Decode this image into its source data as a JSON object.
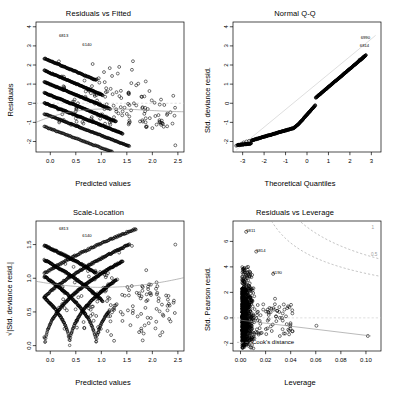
{
  "figure": {
    "layout": "2x2 grid of regression diagnostic plots",
    "width": 393,
    "height": 398,
    "background": "#ffffff",
    "point_color": "#000000",
    "smooth_color": "#8c8c8c",
    "reference_color": "#c8c8c8"
  },
  "chart_data": [
    {
      "type": "scatter",
      "title": "Residuals vs Fitted",
      "xlabel": "Predicted values",
      "ylabel": "Residuals",
      "xlim": [
        -0.28,
        2.62
      ],
      "ylim": [
        -2.55,
        4.25
      ],
      "xticks": [
        "0.0",
        "0.5",
        "1.0",
        "1.5",
        "2.0",
        "2.5"
      ],
      "xtickvals": [
        0.0,
        0.5,
        1.0,
        1.5,
        2.0,
        2.5
      ],
      "yticks": [
        "4",
        "3",
        "2",
        "1",
        "0",
        "-1",
        "-2"
      ],
      "ytickvals": [
        4,
        3,
        2,
        1,
        0,
        -1,
        -2
      ],
      "grid": false,
      "legend": "none",
      "annotations": [
        {
          "text": "6813",
          "x": 0.26,
          "y": 3.45
        },
        {
          "text": "6140",
          "x": 0.72,
          "y": 3.0
        }
      ],
      "zero_line": true,
      "smooth_curve": true,
      "description": "Dense parallel diagonal bands of residuals typical of a GLM with discrete outcome; band slope negative, plus scattered open circles at higher predicted values."
    },
    {
      "type": "scatter",
      "title": "Normal Q-Q",
      "xlabel": "Theoretical Quantiles",
      "ylabel": "Std. deviance resid.",
      "xlim": [
        -3.45,
        3.45
      ],
      "ylim": [
        -2.55,
        4.25
      ],
      "xticks": [
        "-3",
        "-2",
        "-1",
        "0",
        "1",
        "2",
        "3"
      ],
      "xtickvals": [
        -3,
        -2,
        -1,
        0,
        1,
        2,
        3
      ],
      "yticks": [
        "4",
        "3",
        "2",
        "1",
        "0",
        "-1",
        "-2"
      ],
      "ytickvals": [
        4,
        3,
        2,
        1,
        0,
        -1,
        -2
      ],
      "grid": false,
      "legend": "none",
      "annotations": [
        {
          "text": "6990",
          "x": 2.72,
          "y": 3.35
        },
        {
          "text": "6814",
          "x": 2.68,
          "y": 2.95
        }
      ],
      "qq_reference_line": true,
      "description": "Heavy solid band of ordered standardized deviance residuals rising from about -2.2 to 2.5, with a pronounced flat step near theoretical quantile -0.5."
    },
    {
      "type": "scatter",
      "title": "Scale-Location",
      "xlabel": "Predicted values",
      "ylabel": "√|Std. deviance resid.|",
      "xlim": [
        -0.28,
        2.62
      ],
      "ylim": [
        -0.08,
        1.85
      ],
      "xticks": [
        "0.0",
        "0.5",
        "1.0",
        "1.5",
        "2.0",
        "2.5"
      ],
      "xtickvals": [
        0.0,
        0.5,
        1.0,
        1.5,
        2.0,
        2.5
      ],
      "yticks": [
        "0.0",
        "0.5",
        "1.0",
        "1.5"
      ],
      "ytickvals": [
        0.0,
        0.5,
        1.0,
        1.5
      ],
      "grid": false,
      "legend": "none",
      "annotations": [
        {
          "text": "6813",
          "x": 0.26,
          "y": 1.71
        },
        {
          "text": "6140",
          "x": 0.72,
          "y": 1.61
        }
      ],
      "smooth_curve": true,
      "description": "Folded V shaped bands meeting near predicted value 0.7 where residuals cross zero; grey smoother roughly flat near 0.85 rising slightly to the right."
    },
    {
      "type": "scatter",
      "title": "Residuals vs Leverage",
      "xlabel": "Leverage",
      "ylabel": "Std. Pearson resid.",
      "xlim": [
        -0.006,
        0.112
      ],
      "ylim": [
        -2.6,
        7.6
      ],
      "xticks": [
        "0.00",
        "0.02",
        "0.04",
        "0.06",
        "0.08",
        "0.10"
      ],
      "xtickvals": [
        0.0,
        0.02,
        0.04,
        0.06,
        0.08,
        0.1
      ],
      "yticks": [
        "6",
        "4",
        "2",
        "0",
        "-2"
      ],
      "ytickvals": [
        6,
        4,
        2,
        0,
        -2
      ],
      "grid": false,
      "legend": "Cook's distance",
      "legend_position": "bottom-left",
      "annotations": [
        {
          "text": "6811",
          "x": 0.005,
          "y": 6.75
        },
        {
          "text": "6814",
          "x": 0.013,
          "y": 5.2
        },
        {
          "text": "6190",
          "x": 0.026,
          "y": 3.45
        }
      ],
      "cook_contours": [
        {
          "label": "1",
          "value": 1
        },
        {
          "label": "0.5",
          "value": 0.5
        }
      ],
      "zero_line": true,
      "smooth_curve": true,
      "description": "Dense vertical column of points at very low leverage spanning -2 to 7, thinning out to isolated points up to leverage 0.10; two dashed grey Cook's distance contours in the upper right."
    }
  ],
  "legend": {
    "cooks_distance_label": "Cook's distance"
  }
}
